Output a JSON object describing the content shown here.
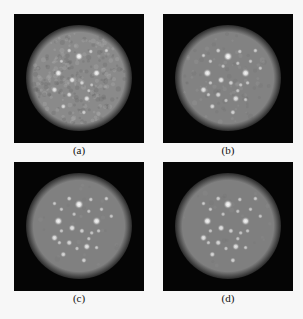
{
  "figure": {
    "panels": [
      {
        "id": "a",
        "label": "(a)",
        "noise": "high",
        "disk_gray": "#8a8a8a"
      },
      {
        "id": "b",
        "label": "(b)",
        "noise": "medium",
        "disk_gray": "#828282"
      },
      {
        "id": "c",
        "label": "(c)",
        "noise": "low",
        "disk_gray": "#808080"
      },
      {
        "id": "d",
        "label": "(d)",
        "noise": "low",
        "disk_gray": "#7f7f7f"
      }
    ],
    "hot_spots": [
      {
        "u": 0.5,
        "v": 0.28,
        "r": 1.0
      },
      {
        "u": 0.29,
        "v": 0.45,
        "r": 0.9
      },
      {
        "u": 0.68,
        "v": 0.45,
        "r": 0.9
      },
      {
        "u": 0.43,
        "v": 0.52,
        "r": 0.7
      },
      {
        "u": 0.25,
        "v": 0.62,
        "r": 0.7
      },
      {
        "u": 0.58,
        "v": 0.71,
        "r": 0.7
      },
      {
        "u": 0.4,
        "v": 0.67,
        "r": 0.55
      },
      {
        "u": 0.34,
        "v": 0.79,
        "r": 0.5
      },
      {
        "u": 0.55,
        "v": 0.85,
        "r": 0.45
      },
      {
        "u": 0.53,
        "v": 0.55,
        "r": 0.45
      },
      {
        "u": 0.4,
        "v": 0.22,
        "r": 0.4
      },
      {
        "u": 0.62,
        "v": 0.23,
        "r": 0.35
      },
      {
        "u": 0.78,
        "v": 0.22,
        "r": 0.35
      },
      {
        "u": 0.25,
        "v": 0.27,
        "r": 0.3
      },
      {
        "u": 0.32,
        "v": 0.33,
        "r": 0.3
      },
      {
        "u": 0.45,
        "v": 0.38,
        "r": 0.3
      },
      {
        "u": 0.6,
        "v": 0.35,
        "r": 0.3
      },
      {
        "u": 0.73,
        "v": 0.33,
        "r": 0.3
      },
      {
        "u": 0.83,
        "v": 0.4,
        "r": 0.3
      },
      {
        "u": 0.32,
        "v": 0.55,
        "r": 0.3
      },
      {
        "u": 0.63,
        "v": 0.57,
        "r": 0.3
      },
      {
        "u": 0.7,
        "v": 0.55,
        "r": 0.3
      },
      {
        "u": 0.3,
        "v": 0.67,
        "r": 0.3
      },
      {
        "u": 0.48,
        "v": 0.73,
        "r": 0.3
      },
      {
        "u": 0.68,
        "v": 0.72,
        "r": 0.3
      },
      {
        "u": 0.6,
        "v": 0.63,
        "r": 0.3
      }
    ]
  }
}
